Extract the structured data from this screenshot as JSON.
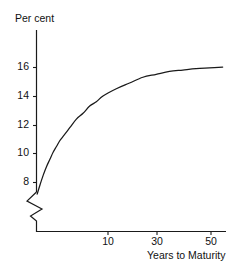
{
  "chart_data": {
    "type": "line",
    "title": "",
    "subtitle": "",
    "xlabel": "Years to Maturity",
    "ylabel": "Per cent",
    "grid": false,
    "legend": null,
    "legend_position": "none",
    "axis_break_x": true,
    "axis_break_y": true,
    "xlim": [
      0,
      57
    ],
    "ylim": [
      7.3,
      16.6
    ],
    "xticks": [
      10,
      30,
      50
    ],
    "xtick_labels": [
      "10",
      "30",
      "50"
    ],
    "yticks": [
      8,
      10,
      12,
      14,
      16
    ],
    "ytick_labels": [
      "8",
      "10",
      "12",
      "14",
      "16"
    ],
    "series": [
      {
        "name": "Yield",
        "x": [
          0.2,
          1,
          2,
          3,
          4,
          5,
          6,
          7,
          8,
          10,
          12,
          14,
          16,
          18,
          20,
          24,
          28,
          32,
          36,
          40,
          44,
          48,
          52,
          56
        ],
        "values": [
          7.5,
          8.1,
          8.8,
          9.4,
          9.9,
          10.4,
          10.8,
          11.2,
          11.5,
          12.1,
          12.7,
          13.1,
          13.6,
          13.9,
          14.3,
          14.8,
          15.2,
          15.6,
          15.8,
          16.0,
          16.1,
          16.2,
          16.25,
          16.3
        ]
      }
    ],
    "colors": {
      "line": "#1a1a1a",
      "axis": "#1a1a1a",
      "text": "#111111",
      "background": "#ffffff"
    }
  },
  "axes": {
    "y_axis_title": "Per cent",
    "x_axis_title": "Years to Maturity",
    "y_tick_labels": [
      "16",
      "14",
      "12",
      "10",
      "8"
    ],
    "x_tick_labels": [
      "10",
      "30",
      "50"
    ]
  },
  "icons": {
    "y_break": "axis-break-zigzag",
    "x_break": "axis-break-zigzag"
  }
}
